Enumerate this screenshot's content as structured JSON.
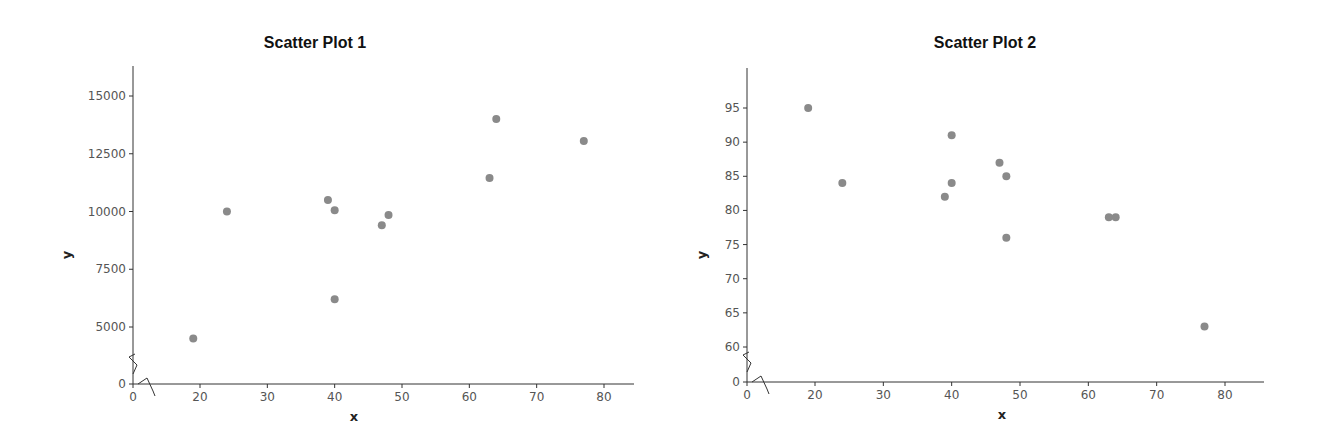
{
  "chart_data": [
    {
      "type": "scatter",
      "title": "Scatter Plot 1",
      "xlabel": "x",
      "ylabel": "y",
      "xlim": [
        0,
        84
      ],
      "ylim": [
        0,
        16000
      ],
      "x_ticks": [
        0,
        20,
        30,
        40,
        50,
        60,
        70,
        80
      ],
      "y_ticks": [
        0,
        5000,
        7500,
        10000,
        12500,
        15000
      ],
      "axis_breaks": {
        "x": [
          0,
          15
        ],
        "y": [
          0,
          2500
        ]
      },
      "grid": false,
      "legend": null,
      "color": "#8a8a8a",
      "points": [
        {
          "x": 19,
          "y": 4500
        },
        {
          "x": 24,
          "y": 10000
        },
        {
          "x": 39,
          "y": 10500
        },
        {
          "x": 40,
          "y": 10050
        },
        {
          "x": 40,
          "y": 6200
        },
        {
          "x": 47,
          "y": 9400
        },
        {
          "x": 48,
          "y": 9850
        },
        {
          "x": 63,
          "y": 11450
        },
        {
          "x": 64,
          "y": 14000
        },
        {
          "x": 77,
          "y": 13050
        }
      ]
    },
    {
      "type": "scatter",
      "title": "Scatter Plot 2",
      "xlabel": "x",
      "ylabel": "y",
      "xlim": [
        0,
        84
      ],
      "ylim": [
        0,
        100
      ],
      "x_ticks": [
        0,
        20,
        30,
        40,
        50,
        60,
        70,
        80
      ],
      "y_ticks": [
        0,
        60,
        65,
        70,
        75,
        80,
        85,
        90,
        95
      ],
      "axis_breaks": {
        "x": [
          0,
          15
        ],
        "y": [
          0,
          55
        ]
      },
      "grid": false,
      "legend": null,
      "color": "#8a8a8a",
      "points": [
        {
          "x": 19,
          "y": 95
        },
        {
          "x": 24,
          "y": 84
        },
        {
          "x": 39,
          "y": 82
        },
        {
          "x": 40,
          "y": 91
        },
        {
          "x": 40,
          "y": 84
        },
        {
          "x": 47,
          "y": 87
        },
        {
          "x": 48,
          "y": 85
        },
        {
          "x": 48,
          "y": 76
        },
        {
          "x": 63,
          "y": 79
        },
        {
          "x": 64,
          "y": 79
        },
        {
          "x": 77,
          "y": 63
        }
      ]
    }
  ]
}
